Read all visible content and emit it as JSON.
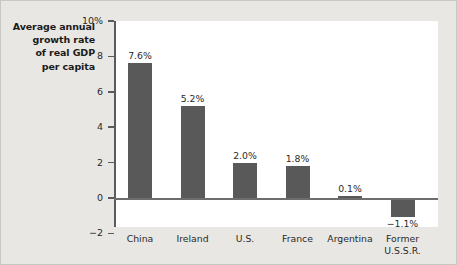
{
  "chart_data": {
    "type": "bar",
    "title": "",
    "ylabel": "Average annual growth rate of real GDP per capita",
    "ylabel_lines": [
      "Average annual",
      "growth rate",
      "of real GDP",
      "per capita"
    ],
    "xlabel": "",
    "categories": [
      "China",
      "Ireland",
      "U.S.",
      "France",
      "Argentina",
      "Former U.S.S.R."
    ],
    "category_lines": [
      [
        "China"
      ],
      [
        "Ireland"
      ],
      [
        "U.S."
      ],
      [
        "France"
      ],
      [
        "Argentina"
      ],
      [
        "Former",
        "U.S.S.R."
      ]
    ],
    "values": [
      7.6,
      5.2,
      2.0,
      1.8,
      0.1,
      -1.1
    ],
    "value_labels": [
      "7.6%",
      "5.2%",
      "2.0%",
      "1.8%",
      "0.1%",
      "−1.1%"
    ],
    "ylim": [
      -2,
      10
    ],
    "yticks": [
      -2,
      0,
      2,
      4,
      6,
      8,
      10
    ],
    "ytick_labels": [
      "−2",
      "0",
      "2",
      "4",
      "6",
      "8",
      "10%"
    ],
    "grid": false,
    "legend": false,
    "colors": {
      "bar": "#595959",
      "plot_background": "#ffffff",
      "figure_background": "#e9e7e3",
      "axis": "#5b5b5b",
      "text": "#2a2a2a"
    }
  }
}
